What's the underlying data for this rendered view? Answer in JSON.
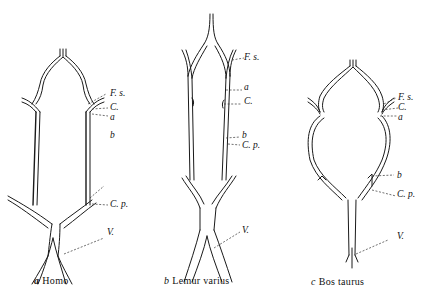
{
  "figure": {
    "panels": [
      {
        "id": "a",
        "letter": "a",
        "species": "Homo",
        "labels": {
          "fs": "F. s.",
          "c": "C.",
          "a": "a",
          "b": "b",
          "cp": "C. p.",
          "v": "V."
        }
      },
      {
        "id": "b",
        "letter": "b",
        "species": "Lemur varius",
        "labels": {
          "fs": "F. s.",
          "a": "a",
          "c": "C.",
          "b": "b",
          "cp": "C. p.",
          "v": "V."
        }
      },
      {
        "id": "c",
        "letter": "c",
        "species": "Bos taurus",
        "labels": {
          "fs": "F. s.",
          "c": "C.",
          "a": "a",
          "b": "b",
          "cp": "C. p.",
          "v": "V."
        }
      }
    ]
  }
}
